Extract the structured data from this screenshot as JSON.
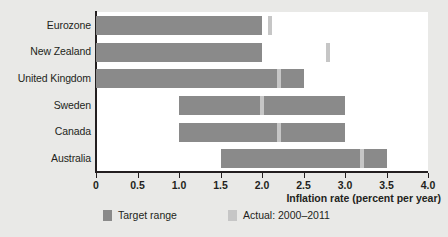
{
  "chart_data": {
    "type": "bar",
    "orientation": "horizontal",
    "title": "",
    "xlabel": "Inflation rate (percent per year)",
    "ylabel": "",
    "xlim": [
      0,
      4.0
    ],
    "xticks": [
      "0",
      "0.5",
      "1.0",
      "1.5",
      "2.0",
      "2.5",
      "3.0",
      "3.5",
      "4.0"
    ],
    "xtick_values": [
      0,
      0.5,
      1.0,
      1.5,
      2.0,
      2.5,
      3.0,
      3.5,
      4.0
    ],
    "grid": false,
    "legend_position": "bottom",
    "categories": [
      "Eurozone",
      "New Zealand",
      "United Kingdom",
      "Sweden",
      "Canada",
      "Australia"
    ],
    "series": [
      {
        "name": "Target range",
        "type": "range",
        "color": "#8a8a8a",
        "values": [
          {
            "category": "Eurozone",
            "low": 0.0,
            "high": 2.0
          },
          {
            "category": "New Zealand",
            "low": 0.0,
            "high": 2.0
          },
          {
            "category": "United Kingdom",
            "low": 0.0,
            "high": 2.5
          },
          {
            "category": "Sweden",
            "low": 1.0,
            "high": 3.0
          },
          {
            "category": "Canada",
            "low": 1.0,
            "high": 3.0
          },
          {
            "category": "Australia",
            "low": 1.5,
            "high": 3.5
          }
        ]
      },
      {
        "name": "Actual: 2000–2011",
        "type": "marker",
        "color": "#c6c6c6",
        "values": [
          {
            "category": "Eurozone",
            "value": 2.1
          },
          {
            "category": "New Zealand",
            "value": 2.8
          },
          {
            "category": "United Kingdom",
            "value": 2.2
          },
          {
            "category": "Sweden",
            "value": 2.0
          },
          {
            "category": "Canada",
            "value": 2.2
          },
          {
            "category": "Australia",
            "value": 3.2
          }
        ]
      }
    ]
  },
  "legend": {
    "items": [
      {
        "label": "Target range",
        "color": "#8a8a8a"
      },
      {
        "label": "Actual: 2000–2011",
        "color": "#c6c6c6"
      }
    ]
  },
  "colors": {
    "target_range": "#8a8a8a",
    "actual": "#c6c6c6",
    "axis": "#231f20",
    "plot_background": "#ffffff",
    "page_background": "#e9e9e7"
  }
}
